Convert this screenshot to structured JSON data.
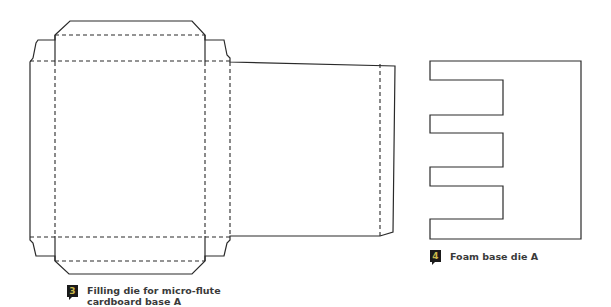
{
  "figures": [
    {
      "number": "3",
      "caption_lines": [
        "Filling die for micro-flute",
        "cardboard base A"
      ],
      "type": "box-template-die"
    },
    {
      "number": "4",
      "caption_lines": [
        "Foam base die A"
      ],
      "type": "comb-shaped-die"
    }
  ],
  "colors": {
    "line": "#2a2a2a",
    "badge_bg": "#1a1a1a",
    "badge_number": "#c9b84a",
    "caption_text": "#3a3a3a"
  }
}
